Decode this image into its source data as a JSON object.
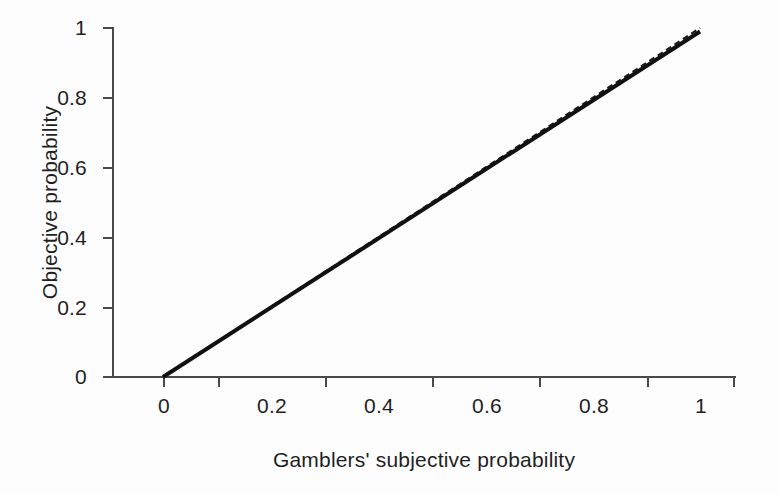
{
  "chart_data": {
    "type": "line",
    "title": "",
    "xlabel": "Gamblers' subjective probability",
    "ylabel": "Objective probability",
    "xlim": [
      0,
      1
    ],
    "ylim": [
      0,
      1
    ],
    "grid": false,
    "legend": "none",
    "xticks": [
      "0",
      "0.2",
      "0.4",
      "0.6",
      "0.8",
      "1"
    ],
    "xtick_values": [
      0,
      0.2,
      0.4,
      0.6,
      0.8,
      1
    ],
    "yticks": [
      "0",
      "0.2",
      "0.4",
      "0.6",
      "0.8",
      "1"
    ],
    "ytick_values": [
      0,
      0.2,
      0.4,
      0.6,
      0.8,
      1
    ],
    "x": [
      0,
      0.1,
      0.2,
      0.3,
      0.4,
      0.5,
      0.6,
      0.7,
      0.8,
      0.9,
      1
    ],
    "series": [
      {
        "name": "Fitted relationship",
        "style": "solid",
        "color": "#111111",
        "width": 4,
        "values": [
          0,
          0.099,
          0.198,
          0.297,
          0.396,
          0.495,
          0.594,
          0.693,
          0.792,
          0.891,
          0.99
        ]
      },
      {
        "name": "Identity line",
        "style": "dashed",
        "color": "#1a1a1a",
        "width": 2,
        "values": [
          0,
          0.1,
          0.2,
          0.3,
          0.4,
          0.5,
          0.6,
          0.7,
          0.8,
          0.9,
          1.0
        ]
      }
    ]
  },
  "axes": {
    "x_axis_name": "x-axis",
    "y_axis_name": "y-axis"
  }
}
